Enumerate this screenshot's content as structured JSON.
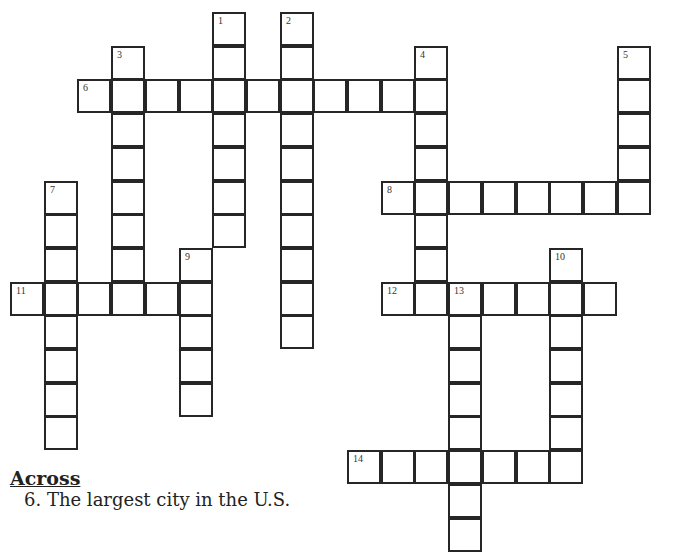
{
  "puzzle": {
    "cell_size": 33.7,
    "origin": {
      "x": 10,
      "y": 12
    },
    "line_color": "#262626",
    "background": "#ffffff",
    "entries": [
      {
        "number": "6",
        "direction": "across",
        "row": 2,
        "col": 2,
        "length": 11
      },
      {
        "number": "8",
        "direction": "across",
        "row": 5,
        "col": 11,
        "length": 8
      },
      {
        "number": "11",
        "direction": "across",
        "row": 8,
        "col": 0,
        "length": 6
      },
      {
        "number": "12",
        "direction": "across",
        "row": 8,
        "col": 11,
        "length": 7
      },
      {
        "number": "14",
        "direction": "across",
        "row": 13,
        "col": 10,
        "length": 7
      },
      {
        "number": "1",
        "direction": "down",
        "row": 0,
        "col": 6,
        "length": 7
      },
      {
        "number": "2",
        "direction": "down",
        "row": 0,
        "col": 8,
        "length": 10
      },
      {
        "number": "3",
        "direction": "down",
        "row": 1,
        "col": 3,
        "length": 8
      },
      {
        "number": "4",
        "direction": "down",
        "row": 1,
        "col": 12,
        "length": 8
      },
      {
        "number": "5",
        "direction": "down",
        "row": 1,
        "col": 18,
        "length": 5
      },
      {
        "number": "7",
        "direction": "down",
        "row": 5,
        "col": 1,
        "length": 8
      },
      {
        "number": "9",
        "direction": "down",
        "row": 7,
        "col": 5,
        "length": 5
      },
      {
        "number": "10",
        "direction": "down",
        "row": 7,
        "col": 16,
        "length": 7
      },
      {
        "number": "13",
        "direction": "down",
        "row": 8,
        "col": 13,
        "length": 8
      }
    ]
  },
  "clues": {
    "across_heading": "Across",
    "across": [
      {
        "number": "6",
        "text": "6. The largest city in the U.S."
      }
    ]
  }
}
